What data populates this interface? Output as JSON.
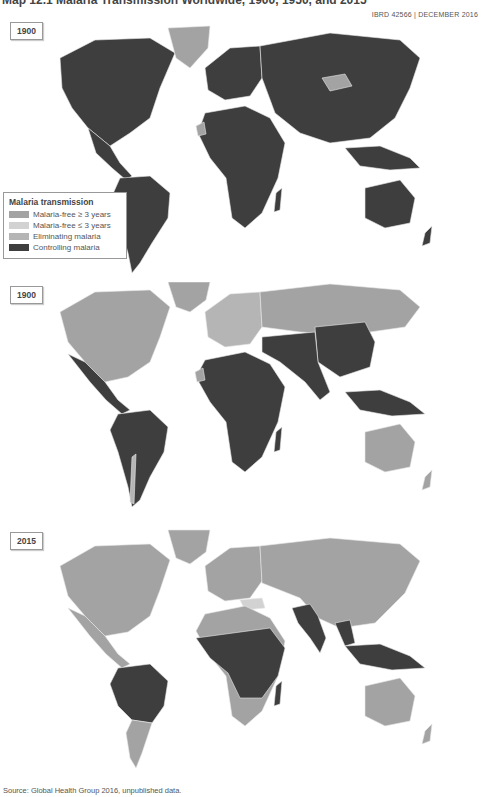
{
  "header": {
    "title": "Map 12.1 Malaria Transmission Worldwide, 1900, 1950, and 2015",
    "map_id": "IBRD 42566 | DECEMBER 2016"
  },
  "legend": {
    "title": "Malaria transmission",
    "items": [
      {
        "label": "Malaria-free ≥ 3 years",
        "color": "#a3a3a3"
      },
      {
        "label": "Malaria-free ≤ 3 years",
        "color": "#d2d2d2"
      },
      {
        "label": "Eliminating malaria",
        "color": "#b5b5b5"
      },
      {
        "label": "Controlling malaria",
        "color": "#3e3e3e"
      }
    ]
  },
  "panels": [
    {
      "year": "1900"
    },
    {
      "year": "1900"
    },
    {
      "year": "2015"
    }
  ],
  "colors": {
    "controlling": "#3e3e3e",
    "free": "#a3a3a3",
    "free_recent": "#d2d2d2",
    "eliminating": "#b5b5b5",
    "border": "#e8e8e8"
  },
  "footer": {
    "source": "Source: Global Health Group 2016, unpublished data."
  }
}
